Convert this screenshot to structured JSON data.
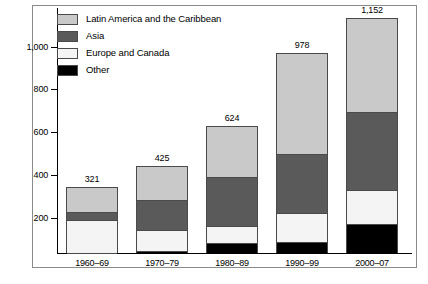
{
  "chart_data": {
    "type": "bar",
    "subtype": "stacked-bar",
    "title": "",
    "subtitle": "",
    "xlabel": "",
    "ylabel": "",
    "categories": [
      "1960–69",
      "1970–79",
      "1980–89",
      "1990–99",
      "2000–07"
    ],
    "series": [
      {
        "name": "Other",
        "color": "#000000",
        "values": [
          0,
          10,
          50,
          55,
          140
        ]
      },
      {
        "name": "Europe and Canada",
        "color": "#f4f4f4",
        "values": [
          162,
          105,
          80,
          140,
          170
        ]
      },
      {
        "name": "Asia",
        "color": "#5a5a5a",
        "values": [
          40,
          145,
          240,
          290,
          380
        ]
      },
      {
        "name": "Latin America and the Caribbean",
        "color": "#c9c9c9",
        "values": [
          119,
          165,
          254,
          493,
          462
        ]
      }
    ],
    "stack_order_bottom_to_top": [
      "Other",
      "Europe and Canada",
      "Asia",
      "Latin America and the Caribbean"
    ],
    "totals": [
      321,
      425,
      624,
      978,
      1152
    ],
    "total_labels": [
      "321",
      "425",
      "624",
      "978",
      "1,152"
    ],
    "ylim": [
      0,
      1200
    ],
    "yticks": [
      200,
      400,
      600,
      800,
      1000
    ],
    "ytick_labels": [
      "200",
      "400",
      "600",
      "800",
      "1,000"
    ],
    "grid": false,
    "legend_position": "top-left"
  },
  "legend": {
    "items": [
      {
        "label": "Latin America and the Caribbean",
        "key": "latam"
      },
      {
        "label": "Asia",
        "key": "asia"
      },
      {
        "label": "Europe and Canada",
        "key": "europe"
      },
      {
        "label": "Other",
        "key": "other"
      }
    ]
  }
}
